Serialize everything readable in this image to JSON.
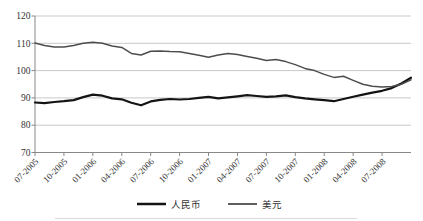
{
  "figure": {
    "background": "#ffffff",
    "grid_color": "#c9c9c9",
    "axis_color": "#888888",
    "label_color": "#333333"
  },
  "chart_data": {
    "type": "line",
    "title": "",
    "xlabel": "",
    "ylabel": "",
    "ylim": [
      70,
      120
    ],
    "y_ticks": [
      120,
      110,
      100,
      90,
      80,
      70
    ],
    "grid": "horizontal",
    "legend_position": "bottom-center",
    "x_tick_interval_months": 3,
    "x_tick_labels": [
      "07-2005",
      "10-2005",
      "01-2006",
      "04-2006",
      "07-2006",
      "10-2006",
      "01-2007",
      "04-2007",
      "07-2007",
      "10-2007",
      "01-2008",
      "04-2008",
      "07-2008"
    ],
    "series": [
      {
        "name": "人民币",
        "color": "#141414",
        "stroke_width": 2.2,
        "values": [
          88.3,
          88.1,
          88.5,
          88.8,
          89.2,
          90.3,
          91.2,
          90.8,
          89.8,
          89.5,
          88.2,
          87.3,
          88.7,
          89.3,
          89.6,
          89.4,
          89.6,
          90.0,
          90.4,
          89.8,
          90.2,
          90.6,
          91.0,
          90.7,
          90.4,
          90.6,
          90.9,
          90.3,
          89.8,
          89.5,
          89.2,
          88.8,
          89.6,
          90.4,
          91.2,
          91.9,
          92.6,
          93.6,
          95.3,
          97.4
        ]
      },
      {
        "name": "美元",
        "color": "#4d4d4d",
        "stroke_width": 1.5,
        "values": [
          110.1,
          109.2,
          108.6,
          108.6,
          109.2,
          110.0,
          110.4,
          110.0,
          109.0,
          108.5,
          106.3,
          105.7,
          107.1,
          107.2,
          107.0,
          106.9,
          106.3,
          105.6,
          104.9,
          105.7,
          106.3,
          105.9,
          105.2,
          104.5,
          103.7,
          104.1,
          103.3,
          102.2,
          100.8,
          100.0,
          98.6,
          97.5,
          97.9,
          96.4,
          95.0,
          94.3,
          94.0,
          94.2,
          95.0,
          96.6
        ]
      }
    ]
  }
}
